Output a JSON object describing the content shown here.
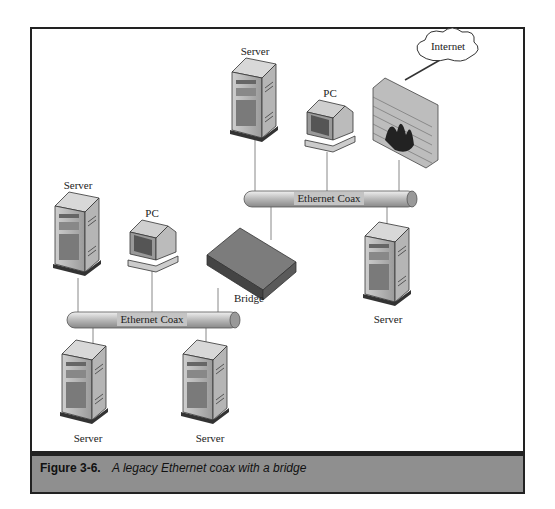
{
  "figure": {
    "number": "Figure 3-6.",
    "caption": "A legacy Ethernet coax with a bridge"
  },
  "nodes": {
    "server_top": "Server",
    "pc_top": "PC",
    "internet": "Internet",
    "server_left": "Server",
    "pc_left": "PC",
    "bridge": "Bridge",
    "server_right": "Server",
    "server_bottom_left": "Server",
    "server_bottom_mid": "Server"
  },
  "segments": {
    "upper": "Ethernet Coax",
    "lower": "Ethernet Coax"
  },
  "colors": {
    "caption_bar": "#8f8f8f",
    "frame_border": "#222222",
    "coax": "#c8c8c8"
  }
}
